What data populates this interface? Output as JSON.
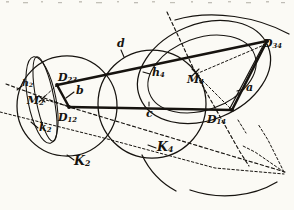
{
  "figure": {
    "name": "four-bar-linkage-circle-construction",
    "kind": "hand-drawn geometric line drawing",
    "ink_color": "#16130f",
    "background_color": "#fbfaf5",
    "width": 294,
    "height": 210
  },
  "labels": {
    "circle_left": {
      "base": "K",
      "sub": "2",
      "x": 76,
      "y": 162
    },
    "circle_right": {
      "base": "K",
      "sub": "4",
      "x": 158,
      "y": 148
    },
    "center_left": {
      "base": "M",
      "sub": "2",
      "x": 28,
      "y": 100
    },
    "center_right": {
      "base": "M",
      "sub": "4",
      "x": 190,
      "y": 70
    },
    "joint_23": {
      "base": "D",
      "sub": "23",
      "x": 57,
      "y": 73
    },
    "joint_12": {
      "base": "D",
      "sub": "12",
      "x": 60,
      "y": 110
    },
    "joint_34": {
      "base": "D",
      "sub": "34",
      "x": 262,
      "y": 42
    },
    "joint_14": {
      "base": "D",
      "sub": "14",
      "x": 212,
      "y": 115
    },
    "side_a": {
      "base": "a",
      "sub": "",
      "x": 246,
      "y": 87
    },
    "side_b": {
      "base": "b",
      "sub": "",
      "x": 75,
      "y": 91
    },
    "side_c": {
      "base": "c",
      "sub": "",
      "x": 148,
      "y": 110
    },
    "side_d": {
      "base": "d",
      "sub": "",
      "x": 118,
      "y": 45
    },
    "axis_k2": {
      "base": "k",
      "sub": "2",
      "x": 39,
      "y": 128
    },
    "axis_h2": {
      "base": "h",
      "sub": "2",
      "x": 22,
      "y": 84
    },
    "axis_h4": {
      "base": "h",
      "sub": "4",
      "x": 152,
      "y": 74
    }
  },
  "label_list": [
    "K2",
    "K4",
    "M2",
    "M4",
    "D23",
    "D12",
    "D34",
    "D14",
    "a",
    "b",
    "c",
    "d",
    "k2",
    "h2",
    "h4"
  ]
}
